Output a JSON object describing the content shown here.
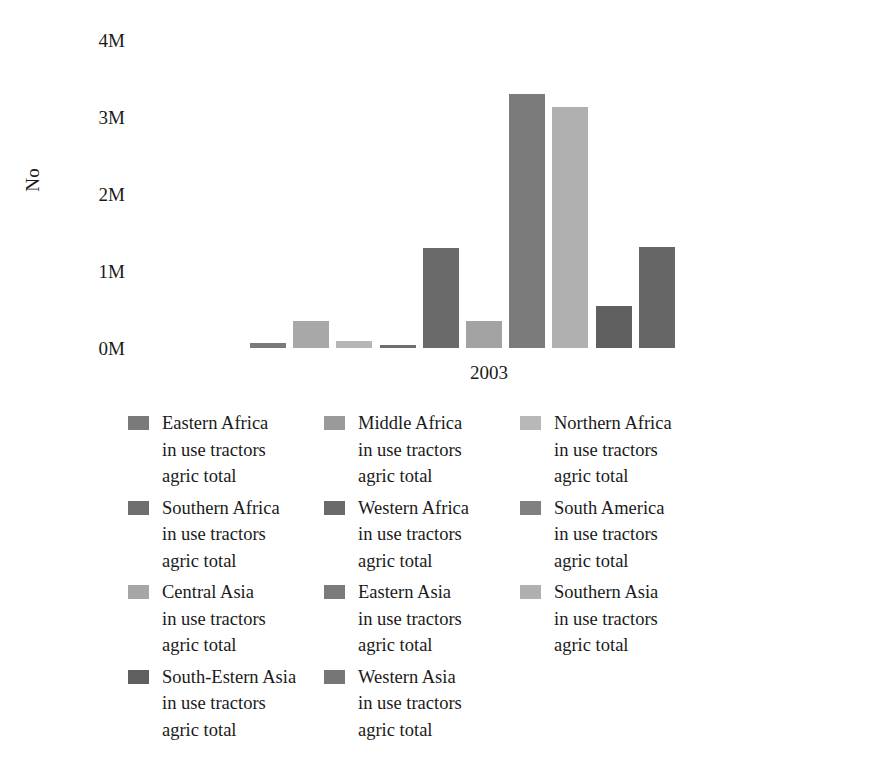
{
  "chart_data": {
    "type": "bar",
    "title": "",
    "subtitle": "",
    "xlabel": "2003",
    "ylabel": "No",
    "categories": [
      "Eastern Africa in use tractors agric total",
      "Middle Africa in use tractors agric total",
      "Northern Africa in use tractors agric total",
      "Southern Africa in use tractors agric total",
      "Western Africa in use tractors agric total",
      "South America in use tractors agric total",
      "Central Asia in use tractors agric total",
      "Eastern Asia in use tractors agric total",
      "Southern Asia in use tractors agric total",
      "South-Estern Asia in use tractors agric total",
      "Western Asia in use tractors agric total"
    ],
    "values": [
      0.07,
      0.35,
      0.09,
      0.04,
      1.3,
      0.35,
      3.3,
      3.13,
      0.54,
      1.31,
      0.0
    ],
    "value_unit": "M",
    "ylim": [
      0,
      4
    ],
    "yticks": [
      "0M",
      "1M",
      "2M",
      "3M",
      "4M"
    ],
    "xticks": [
      "2003"
    ],
    "grid": false,
    "legend_position": "bottom",
    "bar_colors": [
      "#7a7a7a",
      "#a8a8a8",
      "#b6b6b6",
      "#6e6e6e",
      "#6a6a6a",
      "#a3a3a3",
      "#7b7b7b",
      "#b0b0b0",
      "#5f5f5f",
      "#666666",
      "#6d6d6d"
    ]
  },
  "axis": {
    "y_title": "No",
    "x_title": "2003",
    "ticks": [
      {
        "label": "4M",
        "value": 4
      },
      {
        "label": "3M",
        "value": 3
      },
      {
        "label": "2M",
        "value": 2
      },
      {
        "label": "1M",
        "value": 1
      },
      {
        "label": "0M",
        "value": 0
      }
    ]
  },
  "legend": {
    "items": [
      {
        "label": "Eastern Africa\nin use tractors\nagric total",
        "color": "#7a7a7a"
      },
      {
        "label": "Middle Africa\nin use tractors\nagric total",
        "color": "#9a9a9a"
      },
      {
        "label": "Northern Africa\nin use tractors\nagric total",
        "color": "#b8b8b8"
      },
      {
        "label": "Southern Africa\nin use tractors\nagric total",
        "color": "#6e6e6e"
      },
      {
        "label": "Western Africa\nin use tractors\nagric total",
        "color": "#6a6a6a"
      },
      {
        "label": "South America\nin use tractors\nagric total",
        "color": "#808080"
      },
      {
        "label": "Central Asia\nin use tractors\nagric total",
        "color": "#a6a6a6"
      },
      {
        "label": "Eastern Asia\nin use tractors\nagric total",
        "color": "#7b7b7b"
      },
      {
        "label": "Southern Asia\nin use tractors\nagric total",
        "color": "#b0b0b0"
      },
      {
        "label": "South-Estern Asia\nin use tractors\nagric total",
        "color": "#5f5f5f"
      },
      {
        "label": "Western Asia\nin use tractors\nagric total",
        "color": "#767676"
      }
    ]
  }
}
